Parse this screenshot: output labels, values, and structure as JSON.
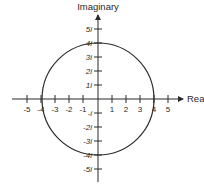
{
  "diagram": {
    "axes": {
      "x_label": "Rea",
      "y_label": "Imaginary",
      "x_ticks": [
        "-5",
        "-4",
        "-3",
        "-2",
        "-1",
        "1",
        "2",
        "3",
        "4",
        "5"
      ],
      "y_ticks": [
        "5i",
        "4i",
        "3i",
        "2i",
        "1i",
        "-i",
        "-2i",
        "-3i",
        "-4i",
        "-5i"
      ]
    },
    "circle": {
      "center": [
        0,
        0
      ],
      "radius": 4
    },
    "colors": {
      "stroke": "#2a2a2a",
      "background": "#ffffff"
    }
  }
}
